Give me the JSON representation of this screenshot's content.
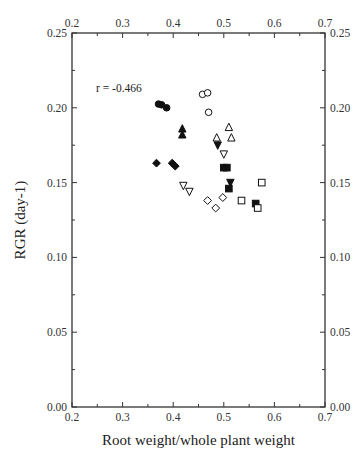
{
  "chart_data": {
    "type": "scatter",
    "title": "",
    "xlabel": "Root weight/whole plant weight",
    "ylabel": "RGR (day-1)",
    "xlim": [
      0.2,
      0.7
    ],
    "ylim": [
      0.0,
      0.25
    ],
    "x_ticks": [
      "0.2",
      "0.3",
      "0.4",
      "0.5",
      "0.6",
      "0.7"
    ],
    "y_ticks": [
      "0.00",
      "0.05",
      "0.10",
      "0.15",
      "0.20",
      "0.25"
    ],
    "grid": false,
    "legend": null,
    "annotations": [
      {
        "text": "r = -0.466",
        "x": 0.25,
        "y": 0.212
      }
    ],
    "series": [
      {
        "name": "filled-circle",
        "marker": "circle",
        "filled": true,
        "points": [
          [
            0.371,
            0.2025
          ],
          [
            0.377,
            0.202
          ],
          [
            0.387,
            0.2
          ]
        ]
      },
      {
        "name": "filled-triangle",
        "marker": "triangle-up",
        "filled": true,
        "points": [
          [
            0.418,
            0.186
          ],
          [
            0.418,
            0.182
          ]
        ]
      },
      {
        "name": "filled-diamond",
        "marker": "diamond",
        "filled": true,
        "points": [
          [
            0.367,
            0.163
          ],
          [
            0.398,
            0.163
          ],
          [
            0.404,
            0.161
          ]
        ]
      },
      {
        "name": "open-triangle-down",
        "marker": "triangle-down",
        "filled": false,
        "points": [
          [
            0.42,
            0.148
          ],
          [
            0.432,
            0.144
          ],
          [
            0.5,
            0.169
          ]
        ]
      },
      {
        "name": "filled-triangle-down",
        "marker": "triangle-down",
        "filled": true,
        "points": [
          [
            0.488,
            0.175
          ],
          [
            0.513,
            0.15
          ]
        ]
      },
      {
        "name": "open-circle",
        "marker": "circle",
        "filled": false,
        "points": [
          [
            0.458,
            0.209
          ],
          [
            0.468,
            0.21
          ],
          [
            0.47,
            0.197
          ]
        ]
      },
      {
        "name": "open-triangle",
        "marker": "triangle-up",
        "filled": false,
        "points": [
          [
            0.51,
            0.187
          ],
          [
            0.486,
            0.18
          ],
          [
            0.515,
            0.18
          ]
        ]
      },
      {
        "name": "filled-square",
        "marker": "square",
        "filled": true,
        "points": [
          [
            0.5,
            0.16
          ],
          [
            0.506,
            0.16
          ],
          [
            0.51,
            0.146
          ],
          [
            0.563,
            0.136
          ]
        ]
      },
      {
        "name": "open-diamond",
        "marker": "diamond",
        "filled": false,
        "points": [
          [
            0.468,
            0.138
          ],
          [
            0.484,
            0.133
          ],
          [
            0.498,
            0.14
          ]
        ]
      },
      {
        "name": "open-square",
        "marker": "square",
        "filled": false,
        "points": [
          [
            0.535,
            0.138
          ],
          [
            0.575,
            0.15
          ],
          [
            0.567,
            0.133
          ]
        ]
      }
    ]
  }
}
